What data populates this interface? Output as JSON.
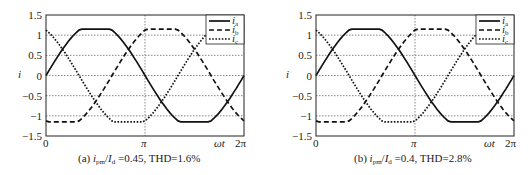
{
  "chart_data": [
    {
      "type": "line",
      "caption_prefix": "(a)",
      "caption_ratio": "i_pm/I_d",
      "caption_value": "=0.45, THD=1.6%",
      "title": "(a) i_pm/I_d=0.45, THD=1.6%",
      "xlabel": "ωt",
      "ylabel": "i",
      "xticks": [
        "0",
        "π",
        "2π"
      ],
      "yticks": [
        "1.5",
        "1",
        "0.5",
        "0",
        "−0.5",
        "−1",
        "−1.5"
      ],
      "ylim": [
        -1.5,
        1.5
      ],
      "xlim": [
        0,
        6.2832
      ],
      "grid": true,
      "legend_position": "upper right",
      "x": [
        0,
        0.5236,
        1.0472,
        1.5708,
        2.0944,
        2.618,
        3.1416,
        3.6652,
        4.1888,
        4.7124,
        5.236,
        5.7596,
        6.2832
      ],
      "series": [
        {
          "name": "i_a",
          "style": "solid",
          "values": [
            0,
            0.58,
            0.98,
            1.15,
            0.98,
            0.58,
            0,
            -0.58,
            -0.98,
            -1.15,
            -0.98,
            -0.58,
            0
          ]
        },
        {
          "name": "i_b",
          "style": "dashed",
          "values": [
            -1.0,
            -1.15,
            -0.98,
            -0.58,
            0,
            0.58,
            1.0,
            1.15,
            0.98,
            0.58,
            0,
            -0.58,
            -1.0
          ]
        },
        {
          "name": "i_c",
          "style": "dotted",
          "values": [
            1.0,
            0.58,
            0,
            -0.58,
            -0.98,
            -1.15,
            -1.0,
            -0.58,
            0,
            0.58,
            0.98,
            1.15,
            1.0
          ]
        }
      ]
    },
    {
      "type": "line",
      "caption_prefix": "(b)",
      "caption_ratio": "i_pm/I_d",
      "caption_value": "=0.4, THD=2.8%",
      "title": "(b) i_pm/I_d=0.4, THD=2.8%",
      "xlabel": "ωt",
      "ylabel": "i",
      "xticks": [
        "0",
        "π",
        "2π"
      ],
      "yticks": [
        "1.5",
        "1",
        "0.5",
        "0",
        "−0.5",
        "−1",
        "−1.5"
      ],
      "ylim": [
        -1.5,
        1.5
      ],
      "xlim": [
        0,
        6.2832
      ],
      "grid": true,
      "legend_position": "upper right",
      "x": [
        0,
        0.5236,
        1.0472,
        1.5708,
        2.0944,
        2.618,
        3.1416,
        3.6652,
        4.1888,
        4.7124,
        5.236,
        5.7596,
        6.2832
      ],
      "series": [
        {
          "name": "i_a",
          "style": "solid",
          "values": [
            0,
            0.6,
            0.98,
            1.15,
            0.98,
            0.6,
            0,
            -0.6,
            -0.98,
            -1.15,
            -0.98,
            -0.6,
            0
          ]
        },
        {
          "name": "i_b",
          "style": "dashed",
          "values": [
            -1.0,
            -1.15,
            -0.98,
            -0.6,
            0,
            0.6,
            1.0,
            1.15,
            0.98,
            0.6,
            0,
            -0.6,
            -1.0
          ]
        },
        {
          "name": "i_c",
          "style": "dotted",
          "values": [
            1.0,
            0.6,
            0,
            -0.6,
            -0.98,
            -1.15,
            -1.0,
            -0.6,
            0,
            0.6,
            0.98,
            1.15,
            1.0
          ]
        }
      ]
    }
  ],
  "labels": {
    "ylabel": "i",
    "xlabel": "ωt",
    "legend": [
      "a",
      "b",
      "c"
    ],
    "yticks": [
      "1.5",
      "1",
      "0.5",
      "0",
      "−0.5",
      "−1",
      "−1.5"
    ],
    "xtick_0": "0",
    "xtick_pi": "π",
    "xtick_2pi": "2π",
    "cap_a_prefix": "(a) ",
    "cap_a_var": "i",
    "cap_a_sub": "pm",
    "cap_a_slash": "/",
    "cap_a_var2": "I",
    "cap_a_sub2": "d",
    "cap_a_rest": " =0.45, THD=1.6%",
    "cap_b_prefix": "(b) ",
    "cap_b_var": "i",
    "cap_b_sub": "pm",
    "cap_b_slash": "/",
    "cap_b_var2": "I",
    "cap_b_sub2": "d",
    "cap_b_rest": " =0.4, THD=2.8%"
  }
}
